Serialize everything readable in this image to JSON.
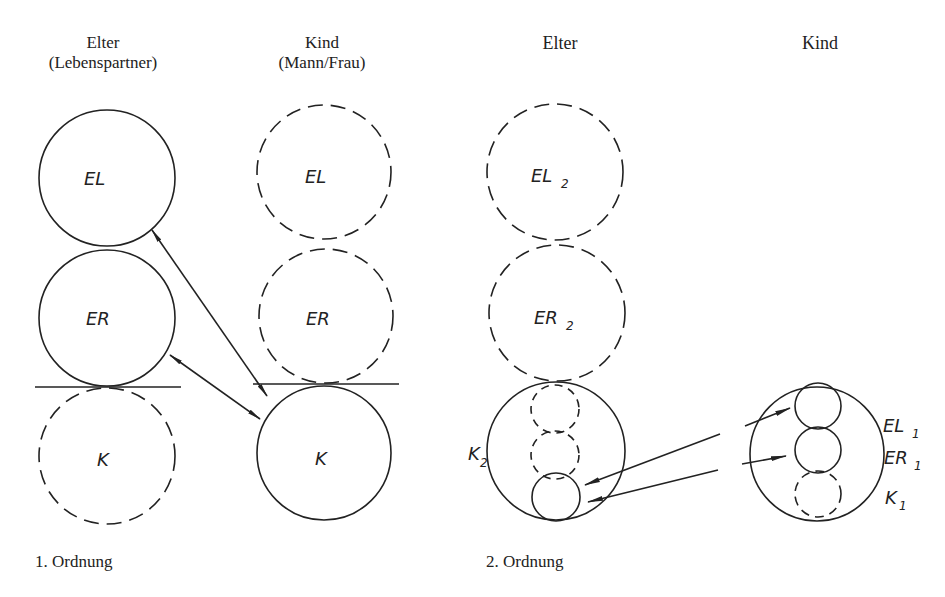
{
  "diagram": {
    "order1": {
      "col_parent": {
        "title": "Elter",
        "subtitle": "(Lebenspartner)"
      },
      "col_child": {
        "title": "Kind",
        "subtitle": "(Mann/Frau)"
      },
      "parent_circles": [
        {
          "label": "EL",
          "style": "solid"
        },
        {
          "label": "ER",
          "style": "solid"
        },
        {
          "label": "K",
          "style": "dashed"
        }
      ],
      "child_circles": [
        {
          "label": "EL",
          "style": "dashed"
        },
        {
          "label": "ER",
          "style": "dashed"
        },
        {
          "label": "K",
          "style": "solid"
        }
      ],
      "caption": "1. Ordnung"
    },
    "order2": {
      "col_parent": {
        "title": "Elter"
      },
      "col_child": {
        "title": "Kind"
      },
      "parent_circles": [
        {
          "label": "EL",
          "sub": "2",
          "style": "dashed"
        },
        {
          "label": "ER",
          "sub": "2",
          "style": "dashed"
        },
        {
          "label": "K",
          "sub": "2",
          "style": "solid"
        }
      ],
      "child_labels": [
        {
          "label": "EL",
          "sub": "1"
        },
        {
          "label": "ER",
          "sub": "1"
        },
        {
          "label": "K",
          "sub": "1"
        }
      ],
      "caption": "2. Ordnung"
    },
    "colors": {
      "ink": "#222222",
      "background": "#ffffff"
    }
  }
}
